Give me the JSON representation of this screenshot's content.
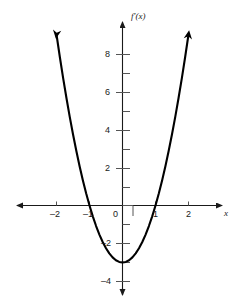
{
  "chart_data": {
    "type": "line",
    "title": "",
    "subtitle": "",
    "xlabel": "x",
    "ylabel": "f'(x)",
    "curve_label": "f'(x)",
    "equation": "y = 3x^2 - 3",
    "xlim": [
      -2.6,
      2.6
    ],
    "ylim": [
      -4.9,
      9.6
    ],
    "grid": false,
    "legend": null,
    "axis_arrows": [
      "left",
      "right",
      "up",
      "down"
    ],
    "curve_end_arrows": [
      "left-branch-up",
      "right-branch-up"
    ],
    "x_ticks_major": [
      -2,
      -1,
      0,
      1,
      2
    ],
    "x_tick_labels": [
      "-2",
      "-1",
      "0",
      "1",
      "2"
    ],
    "y_ticks_major": [
      -4,
      -2,
      0,
      2,
      4,
      6,
      8
    ],
    "y_tick_labels": [
      "-4",
      "-2",
      "0",
      "2",
      "4",
      "6",
      "8"
    ],
    "y_ticks_minor": [
      -3,
      -1,
      1,
      3,
      5,
      7,
      9
    ],
    "x_roots": [
      -1,
      1
    ],
    "vertex": [
      0,
      -3
    ],
    "x": [
      -2.0,
      -1.9,
      -1.8,
      -1.7,
      -1.6,
      -1.5,
      -1.4,
      -1.3,
      -1.2,
      -1.1,
      -1.0,
      -0.9,
      -0.8,
      -0.7,
      -0.6,
      -0.5,
      -0.4,
      -0.3,
      -0.2,
      -0.1,
      0.0,
      0.1,
      0.2,
      0.3,
      0.4,
      0.5,
      0.6,
      0.7,
      0.8,
      0.9,
      1.0,
      1.1,
      1.2,
      1.3,
      1.4,
      1.5,
      1.6,
      1.7,
      1.8,
      1.9,
      2.0
    ],
    "values": [
      9.0,
      7.83,
      6.72,
      5.67,
      4.68,
      3.75,
      2.88,
      2.07,
      1.32,
      0.63,
      0.0,
      -0.57,
      -1.08,
      -1.53,
      -1.92,
      -2.25,
      -2.52,
      -2.73,
      -2.88,
      -2.97,
      -3.0,
      -2.97,
      -2.88,
      -2.73,
      -2.52,
      -2.25,
      -1.92,
      -1.53,
      -1.08,
      -0.57,
      0.0,
      0.63,
      1.32,
      2.07,
      2.88,
      3.75,
      4.68,
      5.67,
      6.72,
      7.83,
      9.0
    ],
    "series": [
      {
        "name": "f'(x)",
        "color": "#000000",
        "values": [
          9.0,
          7.83,
          6.72,
          5.67,
          4.68,
          3.75,
          2.88,
          2.07,
          1.32,
          0.63,
          0.0,
          -0.57,
          -1.08,
          -1.53,
          -1.92,
          -2.25,
          -2.52,
          -2.73,
          -2.88,
          -2.97,
          -3.0,
          -2.97,
          -2.88,
          -2.73,
          -2.52,
          -2.25,
          -1.92,
          -1.53,
          -1.08,
          -0.57,
          0.0,
          0.63,
          1.32,
          2.07,
          2.88,
          3.75,
          4.68,
          5.67,
          6.72,
          7.83,
          9.0
        ]
      }
    ]
  },
  "colors": {
    "curve": "#000000",
    "axis": "#1a1a1a",
    "tick": "#555555",
    "background": "#ffffff",
    "text": "#1a1a1a"
  },
  "labels": {
    "x_axis_name": "x",
    "y_axis_name": "f'(x)",
    "x_neg2": "–2",
    "x_neg1": "–1",
    "x_zero": "0",
    "x_pos1": "1",
    "x_pos2": "2",
    "y_8": "8",
    "y_6": "6",
    "y_4": "4",
    "y_2": "2",
    "y_neg2": "–2",
    "y_neg4": "–4"
  }
}
